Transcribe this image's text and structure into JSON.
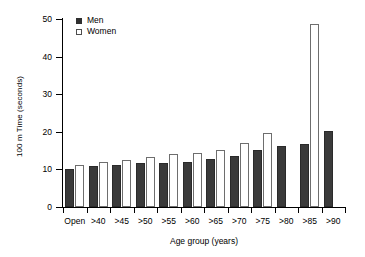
{
  "chart_data": {
    "type": "bar",
    "title": "",
    "xlabel": "Age group (years)",
    "ylabel": "100 m Time (seconds)",
    "categories": [
      "Open",
      ">40",
      ">45",
      ">50",
      ">55",
      ">60",
      ">65",
      ">70",
      ">75",
      ">80",
      ">85",
      ">90"
    ],
    "series": [
      {
        "name": "Men",
        "color": "#3a3a3a",
        "values": [
          10.0,
          11.0,
          11.2,
          11.6,
          11.8,
          12.0,
          12.9,
          13.5,
          15.2,
          16.1,
          16.7,
          20.3
        ]
      },
      {
        "name": "Women",
        "color": "#ffffff",
        "values": [
          11.2,
          12.1,
          12.6,
          13.3,
          14.0,
          14.4,
          15.1,
          16.9,
          19.6,
          null,
          48.7,
          null
        ]
      }
    ],
    "ylim": [
      0,
      50
    ],
    "yticks": [
      0,
      10,
      20,
      30,
      40,
      50
    ],
    "ytick_labels": [
      "0",
      "10",
      "20",
      "30",
      "40",
      "50"
    ],
    "grid": false,
    "legend_position": "top-left",
    "legend": [
      "Men",
      "Women"
    ]
  },
  "legend": {
    "men_label": "Men",
    "women_label": "Women"
  },
  "axes": {
    "y_title": "100 m Time (seconds)",
    "x_title": "Age group (years)"
  }
}
